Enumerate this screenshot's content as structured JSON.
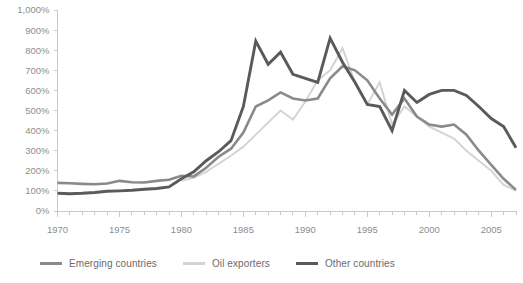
{
  "chart_data": {
    "type": "line",
    "title": "",
    "xlabel": "",
    "ylabel": "",
    "xlim": [
      1970,
      2007
    ],
    "ylim": [
      0,
      1000
    ],
    "grid": false,
    "legend_position": "bottom",
    "y_tick_labels": [
      "1,000%",
      "900%",
      "800%",
      "700%",
      "600%",
      "500%",
      "400%",
      "300%",
      "200%",
      "100%",
      "0%"
    ],
    "y_tick_values": [
      1000,
      900,
      800,
      700,
      600,
      500,
      400,
      300,
      200,
      100,
      0
    ],
    "x_tick_labels": [
      "1970",
      "1975",
      "1980",
      "1985",
      "1990",
      "1995",
      "2000",
      "2005"
    ],
    "x_tick_values": [
      1970,
      1975,
      1980,
      1985,
      1990,
      1995,
      2000,
      2005
    ],
    "x_minor_step": 1,
    "x": [
      1970,
      1971,
      1972,
      1973,
      1974,
      1975,
      1976,
      1977,
      1978,
      1979,
      1980,
      1981,
      1982,
      1983,
      1984,
      1985,
      1986,
      1987,
      1988,
      1989,
      1990,
      1991,
      1992,
      1993,
      1994,
      1995,
      1996,
      1997,
      1998,
      1999,
      2000,
      2001,
      2002,
      2003,
      2004,
      2005,
      2006,
      2007
    ],
    "series": [
      {
        "name": "Emerging countries",
        "color": "#8a8a8a",
        "width": 2.6,
        "values": [
          140,
          138,
          135,
          133,
          137,
          150,
          143,
          142,
          150,
          155,
          175,
          172,
          215,
          270,
          310,
          390,
          520,
          550,
          590,
          560,
          550,
          560,
          660,
          720,
          700,
          650,
          560,
          480,
          560,
          470,
          430,
          420,
          430,
          380,
          300,
          230,
          160,
          105
        ]
      },
      {
        "name": "Oil exporters",
        "color": "#d4d4d4",
        "width": 2.0,
        "values": [
          null,
          null,
          null,
          null,
          null,
          null,
          null,
          null,
          null,
          null,
          150,
          165,
          195,
          235,
          275,
          320,
          380,
          440,
          500,
          455,
          545,
          650,
          700,
          810,
          640,
          530,
          640,
          430,
          520,
          470,
          420,
          390,
          360,
          300,
          250,
          200,
          130,
          100
        ]
      },
      {
        "name": "Other countries",
        "color": "#5a5a5a",
        "width": 2.9,
        "values": [
          88,
          86,
          88,
          92,
          98,
          100,
          103,
          108,
          112,
          120,
          160,
          195,
          250,
          295,
          350,
          520,
          845,
          730,
          790,
          680,
          660,
          640,
          860,
          740,
          640,
          530,
          520,
          400,
          600,
          540,
          580,
          600,
          600,
          575,
          520,
          460,
          420,
          315
        ]
      }
    ],
    "legend": [
      {
        "label": "Emerging countries",
        "color": "#8a8a8a"
      },
      {
        "label": "Oil exporters",
        "color": "#d4d4d4"
      },
      {
        "label": "Other countries",
        "color": "#5a5a5a"
      }
    ]
  }
}
